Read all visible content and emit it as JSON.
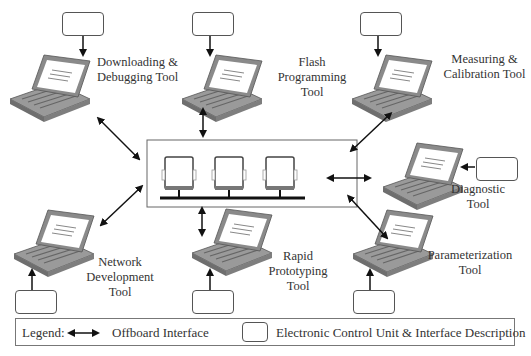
{
  "diagram": {
    "central_network": {
      "label": "ECU network bus",
      "ecu_count": 3
    },
    "tools": [
      {
        "id": "downloading",
        "label_lines": [
          "Downloading &",
          "Debugging Tool"
        ]
      },
      {
        "id": "flash",
        "label_lines": [
          "Flash",
          "Programming",
          "Tool"
        ]
      },
      {
        "id": "measuring",
        "label_lines": [
          "Measuring &",
          "Calibration Tool"
        ]
      },
      {
        "id": "diagnostic",
        "label_lines": [
          "Diagnostic",
          "Tool"
        ]
      },
      {
        "id": "parameterization",
        "label_lines": [
          "Parameterization",
          "Tool"
        ]
      },
      {
        "id": "rapid",
        "label_lines": [
          "Rapid",
          "Prototyping",
          "Tool"
        ]
      },
      {
        "id": "network",
        "label_lines": [
          "Network",
          "Development",
          "Tool"
        ]
      }
    ],
    "colors": {
      "laptop_body": "#9a9a9a",
      "laptop_dark": "#6e6e6e",
      "screen": "#ffffff",
      "arrow": "#111111",
      "border": "#666666"
    }
  },
  "legend": {
    "title": "Legend:",
    "offboard_label": "Offboard Interface",
    "ecu_label": "Electronic Control Unit & Interface Description",
    "arrow_icon": "double-arrow",
    "box_icon": "rounded-rectangle"
  }
}
